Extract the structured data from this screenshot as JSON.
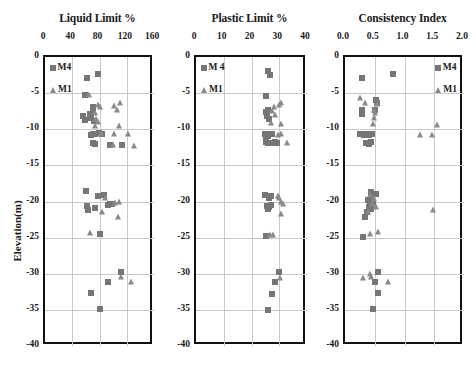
{
  "figure": {
    "ylabel": "Elevation(m)",
    "legend_labels": {
      "m4": "M4",
      "m4_alt": "M 4",
      "m1": "M1"
    },
    "marker_colors": {
      "m4": "#767676",
      "m1": "#8a8a8a"
    },
    "grid_color": "#c9c9c9",
    "frame_color": "#111111",
    "yticks": [
      "0",
      "-5",
      "-10",
      "-15",
      "-20",
      "-25",
      "-30",
      "-35",
      "-40"
    ],
    "ylim": [
      -40,
      0
    ]
  },
  "chart_data": [
    {
      "type": "scatter",
      "title": "Liquid Limit %",
      "xlabel": "Liquid Limit %",
      "ylabel": "Elevation(m)",
      "xlim": [
        0,
        160
      ],
      "ylim": [
        -40,
        0
      ],
      "xticks": [
        0,
        40,
        80,
        120,
        160
      ],
      "xtick_labels": [
        "0",
        "40",
        "80",
        "120",
        "160"
      ],
      "ytick_labels": [
        "0",
        "-5",
        "-10",
        "-15",
        "-20",
        "-25",
        "-30",
        "-35",
        "-40"
      ],
      "grid": true,
      "legend_position": "top-left",
      "series": [
        {
          "name": "M4",
          "marker": "square",
          "color": "#767676",
          "points": [
            [
              62,
              -2.9
            ],
            [
              78,
              -2.3
            ],
            [
              58,
              -5.2
            ],
            [
              56,
              -8.1
            ],
            [
              58,
              -8.7
            ],
            [
              66,
              -7.9
            ],
            [
              67,
              -8.4
            ],
            [
              70,
              -6.9
            ],
            [
              71,
              -7.4
            ],
            [
              72,
              -8.9
            ],
            [
              70,
              -10.6
            ],
            [
              67,
              -10.8
            ],
            [
              73,
              -10.7
            ],
            [
              79,
              -10.5
            ],
            [
              83,
              -10.6
            ],
            [
              70,
              -11.9
            ],
            [
              73,
              -12.1
            ],
            [
              95,
              -12.2
            ],
            [
              113,
              -12.2
            ],
            [
              60,
              -18.5
            ],
            [
              78,
              -19.2
            ],
            [
              87,
              -19.1
            ],
            [
              62,
              -20.6
            ],
            [
              63,
              -21.2
            ],
            [
              74,
              -20.9
            ],
            [
              92,
              -20.5
            ],
            [
              96,
              -20.4
            ],
            [
              99,
              -20.4
            ],
            [
              80,
              -24.5
            ],
            [
              112,
              -29.8
            ],
            [
              93,
              -31.1
            ],
            [
              68,
              -32.7
            ],
            [
              81,
              -34.9
            ]
          ]
        },
        {
          "name": "M1",
          "marker": "triangle",
          "color": "#8a8a8a",
          "points": [
            [
              64,
              -5.3
            ],
            [
              74,
              -7.8
            ],
            [
              78,
              -6.6
            ],
            [
              80,
              -6.9
            ],
            [
              75,
              -8.6
            ],
            [
              78,
              -9.0
            ],
            [
              102,
              -6.8
            ],
            [
              106,
              -7.3
            ],
            [
              110,
              -6.4
            ],
            [
              73,
              -9.6
            ],
            [
              108,
              -9.5
            ],
            [
              82,
              -10.6
            ],
            [
              101,
              -10.7
            ],
            [
              122,
              -10.7
            ],
            [
              100,
              -12.2
            ],
            [
              130,
              -12.3
            ],
            [
              88,
              -19.5
            ],
            [
              103,
              -20.2
            ],
            [
              109,
              -20.0
            ],
            [
              84,
              -21.5
            ],
            [
              107,
              -22.2
            ],
            [
              66,
              -24.3
            ],
            [
              112,
              -30.5
            ],
            [
              126,
              -31.1
            ]
          ]
        }
      ]
    },
    {
      "type": "scatter",
      "title": "Plastic Limit %",
      "xlabel": "Plastic Limit %",
      "ylabel": "Elevation(m)",
      "xlim": [
        0,
        40
      ],
      "ylim": [
        -40,
        0
      ],
      "xticks": [
        0,
        10,
        20,
        30,
        40
      ],
      "xtick_labels": [
        "0",
        "10",
        "20",
        "30",
        "40"
      ],
      "ytick_labels": [
        "0",
        "-5",
        "-10",
        "-15",
        "-20",
        "-25",
        "-30",
        "-35",
        "-40"
      ],
      "grid": true,
      "legend_position": "top-left",
      "series": [
        {
          "name": "M 4",
          "marker": "square",
          "color": "#767676",
          "points": [
            [
              25.8,
              -2.0
            ],
            [
              26.6,
              -2.5
            ],
            [
              25.2,
              -5.4
            ],
            [
              25.1,
              -7.6
            ],
            [
              25.5,
              -8.1
            ],
            [
              26.0,
              -7.4
            ],
            [
              26.2,
              -8.6
            ],
            [
              25.0,
              -10.6
            ],
            [
              25.4,
              -11.0
            ],
            [
              25.8,
              -10.9
            ],
            [
              26.2,
              -10.7
            ],
            [
              27.3,
              -10.7
            ],
            [
              25.2,
              -11.8
            ],
            [
              26.0,
              -11.9
            ],
            [
              27.0,
              -11.9
            ],
            [
              28.3,
              -11.8
            ],
            [
              29.3,
              -11.9
            ],
            [
              24.8,
              -19.1
            ],
            [
              26.3,
              -19.5
            ],
            [
              27.0,
              -19.3
            ],
            [
              25.5,
              -20.6
            ],
            [
              25.9,
              -21.0
            ],
            [
              26.3,
              -20.7
            ],
            [
              27.2,
              -20.5
            ],
            [
              25.3,
              -24.8
            ],
            [
              29.8,
              -29.8
            ],
            [
              28.6,
              -31.1
            ],
            [
              27.3,
              -32.8
            ],
            [
              25.8,
              -35.0
            ]
          ]
        },
        {
          "name": "M1",
          "marker": "triangle",
          "color": "#8a8a8a",
          "points": [
            [
              28.0,
              -6.9
            ],
            [
              29.8,
              -6.6
            ],
            [
              30.8,
              -6.3
            ],
            [
              27.3,
              -7.5
            ],
            [
              28.3,
              -8.0
            ],
            [
              27.0,
              -9.1
            ],
            [
              30.8,
              -9.3
            ],
            [
              29.5,
              -10.8
            ],
            [
              30.5,
              -10.7
            ],
            [
              32.8,
              -11.9
            ],
            [
              29.6,
              -19.2
            ],
            [
              30.0,
              -19.5
            ],
            [
              30.8,
              -20.0
            ],
            [
              31.2,
              -20.3
            ],
            [
              30.5,
              -21.7
            ],
            [
              26.7,
              -24.6
            ],
            [
              27.8,
              -24.7
            ],
            [
              30.3,
              -30.6
            ]
          ]
        }
      ]
    },
    {
      "type": "scatter",
      "title": "Consistency Index",
      "xlabel": "Consistency Index",
      "ylabel": "Elevation(m)",
      "xlim": [
        0.0,
        2.0
      ],
      "ylim": [
        -40,
        0
      ],
      "xticks": [
        0.0,
        0.5,
        1.0,
        1.5,
        2.0
      ],
      "xtick_labels": [
        "0.0",
        "0.5",
        "1.0",
        "1.5",
        "2.0"
      ],
      "ytick_labels": [
        "0",
        "-5",
        "-10",
        "-15",
        "-20",
        "-25",
        "-30",
        "-35",
        "-40"
      ],
      "grid": true,
      "legend_position": "top-right",
      "series": [
        {
          "name": "M4",
          "marker": "square",
          "color": "#767676",
          "points": [
            [
              0.29,
              -2.9
            ],
            [
              0.8,
              -2.4
            ],
            [
              0.52,
              -5.9
            ],
            [
              0.53,
              -6.4
            ],
            [
              0.28,
              -7.4
            ],
            [
              0.29,
              -7.9
            ],
            [
              0.5,
              -7.3
            ],
            [
              0.26,
              -10.6
            ],
            [
              0.29,
              -10.7
            ],
            [
              0.32,
              -10.8
            ],
            [
              0.35,
              -10.7
            ],
            [
              0.41,
              -10.8
            ],
            [
              0.46,
              -10.7
            ],
            [
              0.36,
              -11.9
            ],
            [
              0.4,
              -12.1
            ],
            [
              0.43,
              -11.8
            ],
            [
              0.44,
              -18.7
            ],
            [
              0.52,
              -19.0
            ],
            [
              0.46,
              -19.4
            ],
            [
              0.38,
              -19.8
            ],
            [
              0.42,
              -20.0
            ],
            [
              0.47,
              -20.2
            ],
            [
              0.4,
              -20.7
            ],
            [
              0.44,
              -21.0
            ],
            [
              0.37,
              -21.4
            ],
            [
              0.33,
              -22.1
            ],
            [
              0.3,
              -24.9
            ],
            [
              0.56,
              -29.8
            ],
            [
              0.5,
              -31.1
            ],
            [
              0.56,
              -32.7
            ],
            [
              0.47,
              -34.9
            ]
          ]
        },
        {
          "name": "M1",
          "marker": "triangle",
          "color": "#8a8a8a",
          "points": [
            [
              0.26,
              -5.7
            ],
            [
              0.34,
              -6.4
            ],
            [
              0.53,
              -6.5
            ],
            [
              0.49,
              -7.3
            ],
            [
              0.5,
              -7.8
            ],
            [
              0.48,
              -8.5
            ],
            [
              0.47,
              -9.3
            ],
            [
              1.54,
              -9.4
            ],
            [
              1.26,
              -10.8
            ],
            [
              1.46,
              -10.8
            ],
            [
              0.42,
              -19.1
            ],
            [
              0.48,
              -19.6
            ],
            [
              0.46,
              -20.3
            ],
            [
              0.52,
              -20.7
            ],
            [
              0.39,
              -21.4
            ],
            [
              1.48,
              -21.2
            ],
            [
              0.42,
              -24.5
            ],
            [
              0.55,
              -24.2
            ],
            [
              0.3,
              -30.6
            ],
            [
              0.42,
              -30.1
            ],
            [
              0.44,
              -30.5
            ],
            [
              0.73,
              -31.1
            ]
          ]
        }
      ]
    }
  ]
}
